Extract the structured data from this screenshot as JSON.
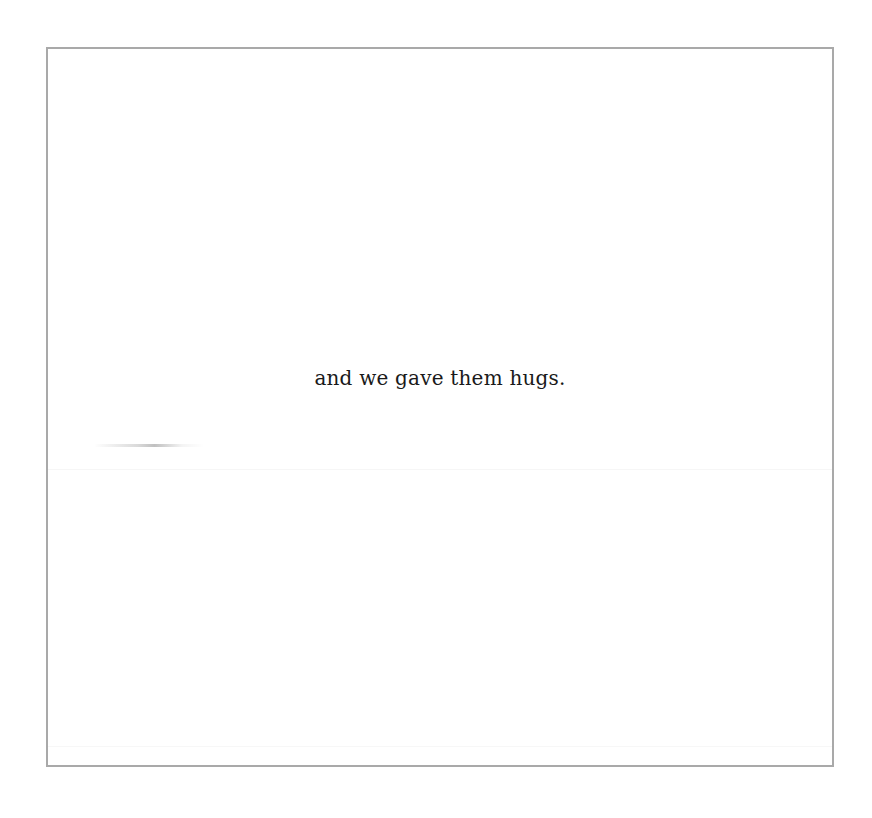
{
  "page": {
    "caption": "and we gave them hugs.",
    "colors": {
      "background": "#ffffff",
      "border": "#a9a9a9",
      "text": "#1a1a1a"
    }
  }
}
